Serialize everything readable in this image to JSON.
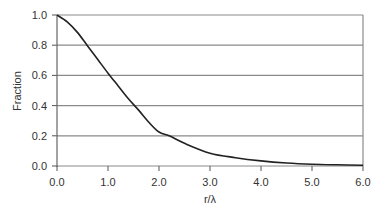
{
  "chart_data": {
    "type": "line",
    "title": "",
    "xlabel": "r/λ",
    "ylabel": "Fraction",
    "xlim": [
      0,
      6
    ],
    "ylim": [
      0,
      1
    ],
    "grid": {
      "horizontal": true,
      "vertical": false
    },
    "legend": null,
    "x_ticks": [
      "0.0",
      "1.0",
      "2.0",
      "3.0",
      "4.0",
      "5.0",
      "6.0"
    ],
    "y_ticks": [
      "0.0",
      "0.2",
      "0.4",
      "0.6",
      "0.8",
      "1.0"
    ],
    "series": [
      {
        "name": "Fraction",
        "color": "#222222",
        "x": [
          0.0,
          0.2,
          0.4,
          0.6,
          0.8,
          1.0,
          1.2,
          1.4,
          1.6,
          1.8,
          2.0,
          2.2,
          2.5,
          3.0,
          3.5,
          4.0,
          4.5,
          5.0,
          5.5,
          6.0
        ],
        "y": [
          1.0,
          0.955,
          0.885,
          0.795,
          0.705,
          0.615,
          0.53,
          0.445,
          0.37,
          0.29,
          0.225,
          0.2,
          0.15,
          0.085,
          0.055,
          0.034,
          0.02,
          0.012,
          0.008,
          0.005
        ]
      }
    ]
  }
}
